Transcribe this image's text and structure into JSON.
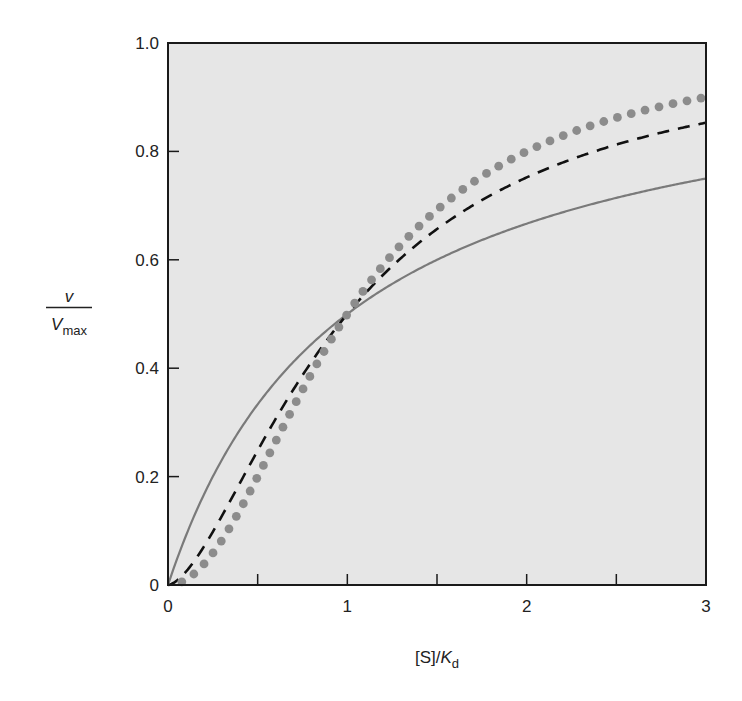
{
  "chart_data": {
    "type": "line",
    "title": "",
    "xlabel": "[S]/K_d",
    "xlabel_parts": {
      "main": "[S]/",
      "italic": "K",
      "subscript": "d"
    },
    "ylabel": "v / V_max",
    "ylabel_parts": {
      "numerator": "v",
      "denominator": "V",
      "subscript": "max"
    },
    "xlim": [
      0,
      3
    ],
    "ylim": [
      0,
      1.0
    ],
    "x_ticks": [
      0,
      0.5,
      1,
      1.5,
      2,
      2.5,
      3
    ],
    "x_tick_labels": [
      "0",
      "",
      "1",
      "",
      "2",
      "",
      "3"
    ],
    "y_ticks": [
      0,
      0.2,
      0.4,
      0.6,
      0.8,
      1.0
    ],
    "y_tick_labels": [
      "0",
      "0.2",
      "0.4",
      "0.6",
      "0.8",
      "1.0"
    ],
    "grid": false,
    "legend": null,
    "background": "#e6e6e6",
    "x": [
      0,
      0.25,
      0.5,
      0.75,
      1.0,
      1.25,
      1.5,
      1.75,
      2.0,
      2.25,
      2.5,
      2.75,
      3.0
    ],
    "series": [
      {
        "name": "hyperbolic (n = 1)",
        "style": "solid",
        "color": "#7a7a7a",
        "hill_n": 1.0,
        "values": [
          0,
          0.2,
          0.333,
          0.429,
          0.5,
          0.556,
          0.6,
          0.636,
          0.667,
          0.692,
          0.714,
          0.733,
          0.75
        ]
      },
      {
        "name": "sigmoidal (n ≈ 1.6)",
        "style": "dashed",
        "color": "#111111",
        "hill_n": 1.6,
        "values": [
          0,
          0.098,
          0.248,
          0.387,
          0.5,
          0.588,
          0.655,
          0.709,
          0.752,
          0.787,
          0.815,
          0.838,
          0.853
        ]
      },
      {
        "name": "sigmoidal (n = 2)",
        "style": "dotted",
        "color": "#8c8c8c",
        "hill_n": 2.0,
        "values": [
          0,
          0.059,
          0.2,
          0.36,
          0.5,
          0.61,
          0.692,
          0.754,
          0.8,
          0.835,
          0.862,
          0.883,
          0.9
        ]
      }
    ]
  }
}
